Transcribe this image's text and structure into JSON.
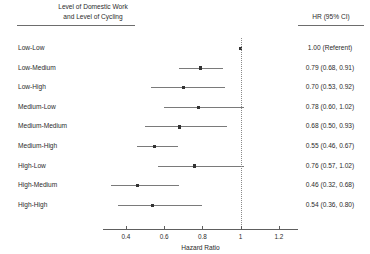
{
  "header": {
    "left_line1": "Level of Domestic Work",
    "left_line2": "and Level of Cycling",
    "right": "HR (95% CI)"
  },
  "chart_data": {
    "type": "line",
    "plot_kind": "forest-plot",
    "title": "",
    "xlabel": "Hazard Ratio",
    "ylabel": "",
    "xlim": [
      0.28,
      1.3
    ],
    "xticks": [
      0.4,
      0.6,
      0.8,
      1,
      1.2
    ],
    "xtick_labels": [
      "0.4",
      "0.6",
      "0.8",
      "1",
      "1.2"
    ],
    "reference_line": 1,
    "grid": false,
    "legend": "none",
    "group_header": "Level of Domestic Work and Level of Cycling",
    "value_header": "HR (95% CI)",
    "categories": [
      "Low-Low",
      "Low-Medium",
      "Low-High",
      "Medium-Low",
      "Medium-Medium",
      "Medium-High",
      "High-Low",
      "High-Medium",
      "High-High"
    ],
    "rows": [
      {
        "label": "Low-Low",
        "hr": 1.0,
        "lcl": null,
        "ucl": null,
        "text": "1.00 (Referent)",
        "referent": true
      },
      {
        "label": "Low-Medium",
        "hr": 0.79,
        "lcl": 0.68,
        "ucl": 0.91,
        "text": "0.79 (0.68, 0.91)",
        "referent": false
      },
      {
        "label": "Low-High",
        "hr": 0.7,
        "lcl": 0.53,
        "ucl": 0.92,
        "text": "0.70 (0.53, 0.92)",
        "referent": false
      },
      {
        "label": "Medium-Low",
        "hr": 0.78,
        "lcl": 0.6,
        "ucl": 1.02,
        "text": "0.78 (0.60, 1.02)",
        "referent": false
      },
      {
        "label": "Medium-Medium",
        "hr": 0.68,
        "lcl": 0.5,
        "ucl": 0.93,
        "text": "0.68 (0.50, 0.93)",
        "referent": false
      },
      {
        "label": "Medium-High",
        "hr": 0.55,
        "lcl": 0.46,
        "ucl": 0.67,
        "text": "0.55 (0.46, 0.67)",
        "referent": false
      },
      {
        "label": "High-Low",
        "hr": 0.76,
        "lcl": 0.57,
        "ucl": 1.02,
        "text": "0.76 (0.57, 1.02)",
        "referent": false
      },
      {
        "label": "High-Medium",
        "hr": 0.46,
        "lcl": 0.32,
        "ucl": 0.68,
        "text": "0.46 (0.32, 0.68)",
        "referent": false
      },
      {
        "label": "High-High",
        "hr": 0.54,
        "lcl": 0.36,
        "ucl": 0.8,
        "text": "0.54 (0.36, 0.80)",
        "referent": false
      }
    ],
    "colors": {
      "point": "#333333",
      "ci": "#7a7a7a",
      "axis": "#5e5e5e",
      "reference": "#8a8a8a",
      "text": "#2b2b2b"
    }
  }
}
